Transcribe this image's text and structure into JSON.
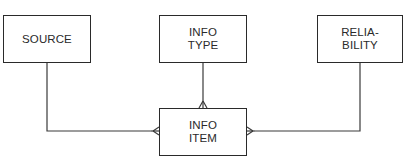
{
  "diagram": {
    "type": "entity-relationship",
    "line_color": "#2a2a2a",
    "entities": [
      {
        "id": "source",
        "label": "SOURCE"
      },
      {
        "id": "info_type",
        "label": "INFO\nTYPE"
      },
      {
        "id": "reliability",
        "label": "RELIA-\nBILITY"
      },
      {
        "id": "info_item",
        "label": "INFO\nITEM"
      }
    ],
    "relationships": [
      {
        "from": "source",
        "to": "info_item",
        "from_cardinality": "one",
        "to_cardinality": "many",
        "marker": "crows-foot"
      },
      {
        "from": "info_type",
        "to": "info_item",
        "from_cardinality": "one",
        "to_cardinality": "many",
        "marker": "crows-foot"
      },
      {
        "from": "reliability",
        "to": "info_item",
        "from_cardinality": "one",
        "to_cardinality": "many",
        "marker": "crows-foot"
      }
    ]
  }
}
